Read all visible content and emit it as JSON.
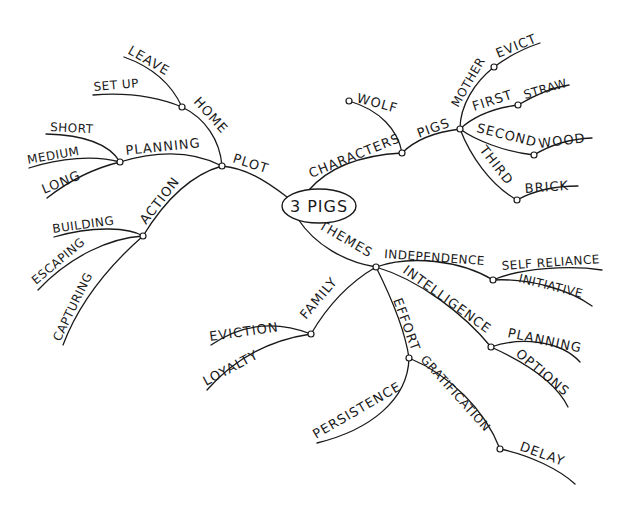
{
  "diagram": {
    "type": "mind-map",
    "style": "hand-drawn",
    "colors": {
      "ink": "#1a1a1a",
      "background": "#ffffff"
    },
    "center": {
      "label": "3 PIGS"
    },
    "branches": {
      "plot": {
        "label": "PLOT",
        "home": {
          "label": "HOME",
          "children": [
            "LEAVE",
            "SET UP"
          ]
        },
        "planning": {
          "label": "PLANNING",
          "children": [
            "SHORT",
            "MEDIUM",
            "LONG"
          ]
        },
        "action": {
          "label": "ACTION",
          "children": [
            "BUILDING",
            "ESCAPING",
            "CAPTURING"
          ]
        }
      },
      "characters": {
        "label": "CHARACTERS",
        "wolf": {
          "label": "WOLF"
        },
        "pigs": {
          "label": "PIGS",
          "mother": {
            "label": "MOTHER",
            "child": "EVICT"
          },
          "first": {
            "label": "FIRST",
            "child": "STRAW"
          },
          "second": {
            "label": "SECOND",
            "child": "WOOD"
          },
          "third": {
            "label": "THIRD",
            "child": "BRICK"
          }
        }
      },
      "themes": {
        "label": "THEMES",
        "independence": {
          "label": "INDEPENDENCE",
          "children": [
            "SELF RELIANCE",
            "INITIATIVE"
          ]
        },
        "intelligence": {
          "label": "INTELLIGENCE",
          "children": [
            "PLANNING",
            "OPTIONS"
          ]
        },
        "family": {
          "label": "FAMILY",
          "children": [
            "EVICTION",
            "LOYALTY"
          ]
        },
        "effort": {
          "label": "EFFORT",
          "persistence": {
            "label": "PERSISTENCE"
          },
          "gratification": {
            "label": "GRATIFICATION",
            "child": "DELAY"
          }
        }
      }
    }
  }
}
